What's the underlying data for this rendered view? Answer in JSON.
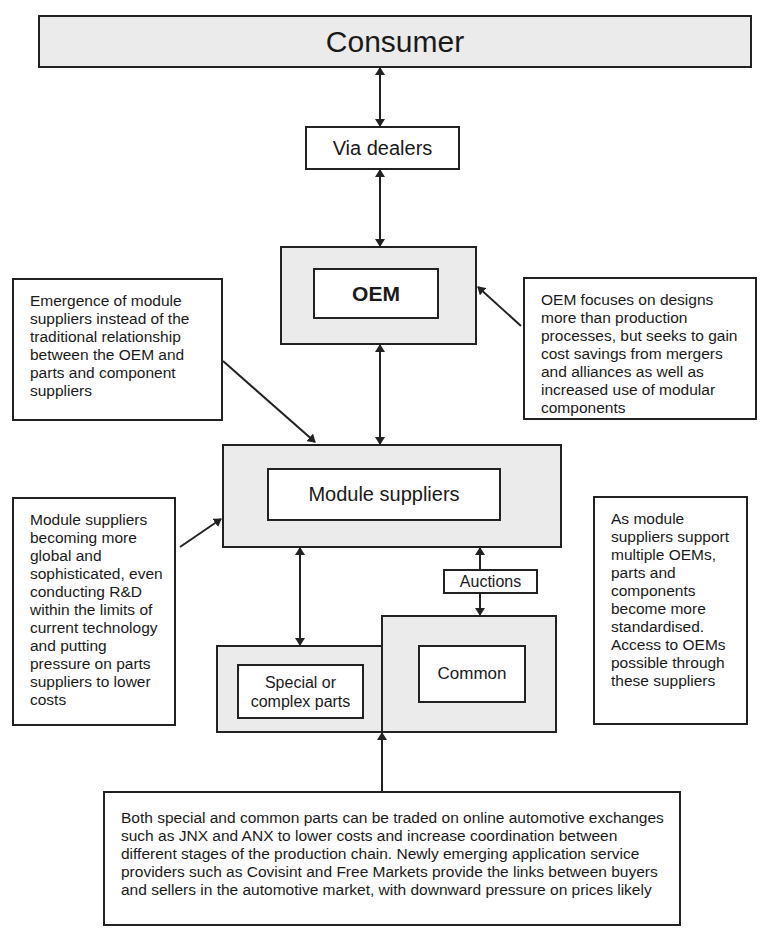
{
  "nodes": {
    "consumer": "Consumer",
    "via_dealers": "Via dealers",
    "oem": "OEM",
    "module_suppliers": "Module suppliers",
    "auctions": "Auctions",
    "special_parts": "Special or complex parts",
    "common": "Common"
  },
  "notes": {
    "emergence": "Emergence of module suppliers instead of the traditional relationship between the OEM and parts and component suppliers",
    "oem_focus": "OEM focuses on designs more than production processes, but seeks to gain cost savings from mergers and alliances as well as increased use of modular components",
    "module_global": "Module suppliers becoming more global and sophisticated, even conducting R&D within the limits of current technology and putting pressure on parts suppliers to lower costs",
    "standardised": "As module suppliers support multiple OEMs, parts and components become more standardised. Access to OEMs possible through these suppliers",
    "exchanges": "Both special and common parts can be traded on online automotive exchanges such as JNX and ANX to lower costs and increase coordination between different stages of the production chain. Newly emerging application service providers such as Covisint and Free Markets provide the links between buyers and sellers in the automotive market, with downward pressure on prices likely"
  }
}
